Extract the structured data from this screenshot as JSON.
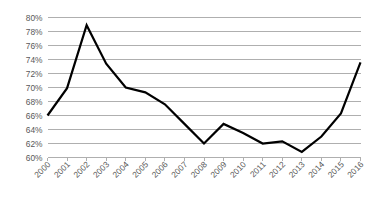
{
  "chart_data": {
    "type": "line",
    "title": "",
    "subtitle": "",
    "xlabel": "",
    "ylabel": "",
    "categories": [
      "2000",
      "2001",
      "2002",
      "2003",
      "2004",
      "2005",
      "2006",
      "2007",
      "2008",
      "2009",
      "2010",
      "2011",
      "2012",
      "2013",
      "2014",
      "2015",
      "2016"
    ],
    "x": [
      2000,
      2001,
      2002,
      2003,
      2004,
      2005,
      2006,
      2007,
      2008,
      2009,
      2010,
      2011,
      2012,
      2013,
      2014,
      2015,
      2016
    ],
    "values": [
      66.0,
      69.9,
      78.9,
      73.4,
      70.0,
      69.3,
      67.6,
      64.8,
      62.0,
      64.8,
      63.5,
      62.0,
      62.3,
      60.8,
      63.0,
      66.3,
      73.6
    ],
    "series": [
      {
        "name": "",
        "values": [
          66.0,
          69.9,
          78.9,
          73.4,
          70.0,
          69.3,
          67.6,
          64.8,
          62.0,
          64.8,
          63.5,
          62.0,
          62.3,
          60.8,
          63.0,
          66.3,
          73.6
        ]
      }
    ],
    "ylim": [
      60,
      80
    ],
    "yticks": [
      60,
      62,
      64,
      66,
      68,
      70,
      72,
      74,
      76,
      78,
      80
    ],
    "ytick_labels": [
      "60%",
      "62%",
      "64%",
      "66%",
      "68%",
      "70%",
      "72%",
      "74%",
      "76%",
      "78%",
      "80%"
    ],
    "xtick_labels": [
      "2000",
      "2001",
      "2002",
      "2003",
      "2004",
      "2005",
      "2006",
      "2007",
      "2008",
      "2009",
      "2010",
      "2011",
      "2012",
      "2013",
      "2014",
      "2015",
      "2016"
    ],
    "grid": true,
    "grid_axis": "y",
    "legend": false,
    "legend_position": "none",
    "annotations": [],
    "colors": {
      "line": "#000000",
      "grid": "#a6a6a6",
      "axis": "#a6a6a6",
      "tick_text": "#595959",
      "background": "#ffffff"
    }
  }
}
